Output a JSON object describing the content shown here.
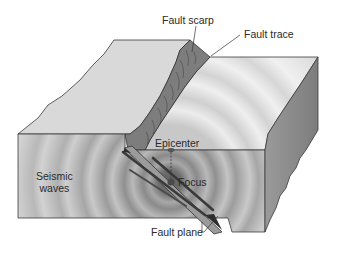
{
  "diagram": {
    "labels": {
      "fault_scarp": "Fault scarp",
      "fault_trace": "Fault trace",
      "epicenter": "Epicenter",
      "focus": "Focus",
      "seismic_waves_line1": "Seismic",
      "seismic_waves_line2": "waves",
      "fault_plane": "Fault plane"
    },
    "colors": {
      "top_face": "#d9d9d9",
      "front_face": "#bdbdbd",
      "side_face": "#8f8f8f",
      "scarp": "#7a7a7a",
      "wave_dark": "#8a8a8a",
      "wave_light": "#cfcfcf",
      "focus_core": "#5e5e5e",
      "outline": "#3a3a3a",
      "label_text": "#2a2a2a"
    }
  }
}
